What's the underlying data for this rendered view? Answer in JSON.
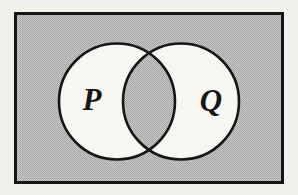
{
  "figure": {
    "kind": "venn-diagram",
    "labels": {
      "p": "P",
      "q": "Q"
    },
    "shading": {
      "outside_circles": "shaded",
      "intersection": "shaded",
      "p_only": "unshaded",
      "q_only": "unshaded"
    },
    "colors": {
      "page_background": "#f2f0ea",
      "shade_light": "#cbcbcb",
      "shade_dark": "#a3a3a3",
      "region_fill": "#f7f6f1",
      "outline": "#161616"
    }
  }
}
